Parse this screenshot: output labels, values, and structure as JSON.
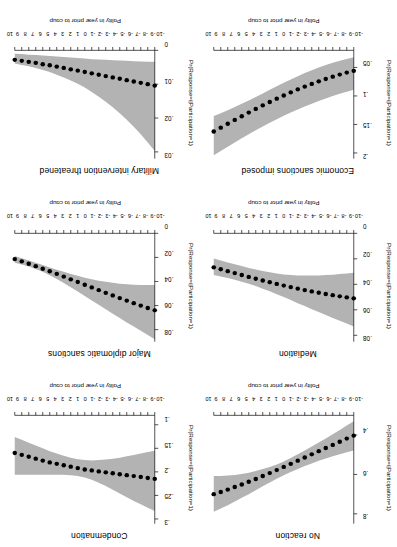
{
  "figure": {
    "orientation_degrees": 180,
    "band_color": "#b3b3b3",
    "point_color": "#000000",
    "axis_color": "#000000"
  },
  "chart_data": [
    {
      "type": "line",
      "title": "No reaction",
      "xlabel": "Polity in year prior to coup",
      "ylabel": "Pr(Response=i|Participation=1)",
      "x": [
        -10,
        -9,
        -8,
        -7,
        -6,
        -5,
        -4,
        -3,
        -2,
        -1,
        0,
        1,
        2,
        3,
        4,
        5,
        6,
        7,
        8,
        9,
        10
      ],
      "xticklabels": [
        "-10",
        "-9",
        "-8",
        "-7",
        "-6",
        "-5",
        "-4",
        "-3",
        "-2",
        "-1",
        "0",
        "1",
        "2",
        "3",
        "4",
        "5",
        "6",
        "7",
        "8",
        "9",
        "10"
      ],
      "yticklabels": [
        ".4",
        ".6",
        ".8"
      ],
      "ylim": [
        0.3,
        0.85
      ],
      "xlim": [
        -10,
        10
      ],
      "grid": false,
      "values": [
        0.403,
        0.418,
        0.434,
        0.45,
        0.466,
        0.482,
        0.498,
        0.514,
        0.53,
        0.546,
        0.562,
        0.578,
        0.593,
        0.608,
        0.623,
        0.637,
        0.651,
        0.664,
        0.677,
        0.689,
        0.7
      ],
      "band_lower": [
        0.33,
        0.352,
        0.374,
        0.396,
        0.417,
        0.438,
        0.458,
        0.478,
        0.498,
        0.517,
        0.534,
        0.549,
        0.562,
        0.573,
        0.583,
        0.592,
        0.598,
        0.603,
        0.606,
        0.608,
        0.608
      ],
      "band_upper": [
        0.478,
        0.487,
        0.497,
        0.508,
        0.519,
        0.531,
        0.544,
        0.557,
        0.572,
        0.588,
        0.604,
        0.622,
        0.641,
        0.66,
        0.68,
        0.7,
        0.719,
        0.738,
        0.756,
        0.773,
        0.79
      ]
    },
    {
      "type": "line",
      "title": "Condemnation",
      "xlabel": "Polity in year prior to coup",
      "ylabel": "Pr(Response=i|Participation=1)",
      "x": [
        -10,
        -9,
        -8,
        -7,
        -6,
        -5,
        -4,
        -3,
        -2,
        -1,
        0,
        1,
        2,
        3,
        4,
        5,
        6,
        7,
        8,
        9,
        10
      ],
      "xticklabels": [
        "-10",
        "-9",
        "-8",
        "-7",
        "-6",
        "-5",
        "-4",
        "-3",
        "-2",
        "-1",
        "0",
        "1",
        "2",
        "3",
        "4",
        "5",
        "6",
        "7",
        "8",
        "9",
        "10"
      ],
      "yticklabels": [
        ".1",
        ".15",
        ".2",
        ".25",
        ".3"
      ],
      "ylim": [
        0.08,
        0.31
      ],
      "xlim": [
        -10,
        10
      ],
      "grid": false,
      "values": [
        0.215,
        0.213,
        0.211,
        0.209,
        0.207,
        0.205,
        0.203,
        0.201,
        0.199,
        0.197,
        0.195,
        0.192,
        0.189,
        0.186,
        0.183,
        0.18,
        0.176,
        0.172,
        0.168,
        0.164,
        0.16
      ],
      "band_lower": [
        0.155,
        0.158,
        0.161,
        0.164,
        0.167,
        0.17,
        0.172,
        0.174,
        0.175,
        0.176,
        0.175,
        0.173,
        0.17,
        0.166,
        0.161,
        0.156,
        0.15,
        0.144,
        0.138,
        0.132,
        0.126
      ],
      "band_upper": [
        0.283,
        0.276,
        0.269,
        0.262,
        0.254,
        0.246,
        0.238,
        0.23,
        0.223,
        0.217,
        0.212,
        0.209,
        0.207,
        0.206,
        0.206,
        0.206,
        0.206,
        0.206,
        0.206,
        0.206,
        0.206
      ]
    },
    {
      "type": "line",
      "title": "Mediation",
      "xlabel": "Polity in year prior to coup",
      "ylabel": "Pr(Response=i|Participation=1)",
      "x": [
        -10,
        -9,
        -8,
        -7,
        -6,
        -5,
        -4,
        -3,
        -2,
        -1,
        0,
        1,
        2,
        3,
        4,
        5,
        6,
        7,
        8,
        9,
        10
      ],
      "xticklabels": [
        "-10",
        "-9",
        "-8",
        "-7",
        "-6",
        "-5",
        "-4",
        "-3",
        "-2",
        "-1",
        "0",
        "1",
        "2",
        "3",
        "4",
        "5",
        "6",
        "7",
        "8",
        "9",
        "10"
      ],
      "yticklabels": [
        "0",
        ".02",
        ".04",
        ".06",
        ".08"
      ],
      "ylim": [
        0.0,
        0.085
      ],
      "xlim": [
        -10,
        10
      ],
      "grid": false,
      "values": [
        0.051,
        0.0502,
        0.0494,
        0.0485,
        0.0476,
        0.0466,
        0.0456,
        0.0445,
        0.0434,
        0.0422,
        0.041,
        0.0397,
        0.0384,
        0.037,
        0.0356,
        0.0342,
        0.0327,
        0.0312,
        0.0297,
        0.0282,
        0.0267
      ],
      "band_lower": [
        0.031,
        0.0315,
        0.032,
        0.0324,
        0.0327,
        0.033,
        0.0331,
        0.0331,
        0.033,
        0.0327,
        0.0322,
        0.0315,
        0.0306,
        0.0296,
        0.0284,
        0.0271,
        0.0257,
        0.0243,
        0.0228,
        0.0213,
        0.0198
      ],
      "band_upper": [
        0.073,
        0.0708,
        0.0686,
        0.0664,
        0.0641,
        0.0618,
        0.0595,
        0.0571,
        0.0548,
        0.0524,
        0.05,
        0.0477,
        0.0455,
        0.0434,
        0.0414,
        0.0396,
        0.0379,
        0.0364,
        0.035,
        0.0338,
        0.0327
      ]
    },
    {
      "type": "line",
      "title": "Major diplomatic sanctions",
      "xlabel": "Polity in year prior to coup",
      "ylabel": "Pr(Response=i|Participation=1)",
      "x": [
        -10,
        -9,
        -8,
        -7,
        -6,
        -5,
        -4,
        -3,
        -2,
        -1,
        0,
        1,
        2,
        3,
        4,
        5,
        6,
        7,
        8,
        9,
        10
      ],
      "xticklabels": [
        "-10",
        "-9",
        "-8",
        "-7",
        "-6",
        "-5",
        "-4",
        "-3",
        "-2",
        "-1",
        "0",
        "1",
        "2",
        "3",
        "4",
        "5",
        "6",
        "7",
        "8",
        "9",
        "10"
      ],
      "yticklabels": [
        "0",
        ".02",
        ".04",
        ".06",
        ".08"
      ],
      "ylim": [
        0.0,
        0.09
      ],
      "xlim": [
        -10,
        10
      ],
      "grid": false,
      "values": [
        0.064,
        0.062,
        0.06,
        0.058,
        0.0559,
        0.0538,
        0.0516,
        0.0494,
        0.0472,
        0.0449,
        0.0427,
        0.0404,
        0.0382,
        0.0359,
        0.0337,
        0.0315,
        0.0294,
        0.0273,
        0.0253,
        0.0233,
        0.0214
      ],
      "band_lower": [
        0.043,
        0.043,
        0.0429,
        0.0427,
        0.0423,
        0.0418,
        0.0411,
        0.0403,
        0.0393,
        0.0381,
        0.0368,
        0.0353,
        0.0337,
        0.032,
        0.0302,
        0.0283,
        0.0264,
        0.0245,
        0.0226,
        0.0207,
        0.0189
      ],
      "band_upper": [
        0.088,
        0.0845,
        0.081,
        0.0775,
        0.074,
        0.0704,
        0.0668,
        0.0631,
        0.0594,
        0.0557,
        0.052,
        0.0483,
        0.0447,
        0.0412,
        0.0379,
        0.0348,
        0.032,
        0.0296,
        0.0275,
        0.0258,
        0.0245
      ]
    },
    {
      "type": "line",
      "title": "Economic sanctions imposed",
      "xlabel": "Polity in year prior to coup",
      "ylabel": "Pr(Response=i|Participation=1)",
      "x": [
        -10,
        -9,
        -8,
        -7,
        -6,
        -5,
        -4,
        -3,
        -2,
        -1,
        0,
        1,
        2,
        3,
        4,
        5,
        6,
        7,
        8,
        9,
        10
      ],
      "xticklabels": [
        "-10",
        "-9",
        "-8",
        "-7",
        "-6",
        "-5",
        "-4",
        "-3",
        "-2",
        "-1",
        "0",
        "1",
        "2",
        "3",
        "4",
        "5",
        "6",
        "7",
        "8",
        "9",
        "10"
      ],
      "yticklabels": [
        ".05",
        ".1",
        ".15",
        ".2"
      ],
      "ylim": [
        0.02,
        0.21
      ],
      "xlim": [
        -10,
        10
      ],
      "grid": false,
      "values": [
        0.056,
        0.059,
        0.0625,
        0.0662,
        0.0702,
        0.0744,
        0.0789,
        0.0836,
        0.0886,
        0.0938,
        0.0992,
        0.1048,
        0.1106,
        0.1166,
        0.1228,
        0.1291,
        0.1356,
        0.1421,
        0.1488,
        0.1556,
        0.1624
      ],
      "band_lower": [
        0.032,
        0.035,
        0.0383,
        0.0419,
        0.0459,
        0.0502,
        0.0549,
        0.0599,
        0.0653,
        0.071,
        0.0769,
        0.083,
        0.0892,
        0.0955,
        0.1017,
        0.1078,
        0.1138,
        0.1195,
        0.125,
        0.1302,
        0.1351
      ],
      "band_upper": [
        0.089,
        0.0925,
        0.0963,
        0.1003,
        0.1045,
        0.1089,
        0.1136,
        0.1185,
        0.1237,
        0.1291,
        0.1348,
        0.1408,
        0.147,
        0.1535,
        0.1602,
        0.1671,
        0.1742,
        0.1815,
        0.1889,
        0.1964,
        0.204
      ]
    },
    {
      "type": "line",
      "title": "Military intervention threatened",
      "xlabel": "Polity in year prior to coup",
      "ylabel": "Pr(Response=i|Participation=1)",
      "x": [
        -10,
        -9,
        -8,
        -7,
        -6,
        -5,
        -4,
        -3,
        -2,
        -1,
        0,
        1,
        2,
        3,
        4,
        5,
        6,
        7,
        8,
        9,
        10
      ],
      "xticklabels": [
        "-10",
        "-9",
        "-8",
        "-7",
        "-6",
        "-5",
        "-4",
        "-3",
        "-2",
        "-1",
        "0",
        "1",
        "2",
        "3",
        "4",
        "5",
        "6",
        "7",
        "8",
        "9",
        "10"
      ],
      "yticklabels": [
        "0",
        ".01",
        ".02",
        ".03"
      ],
      "ylim": [
        0.0,
        0.032
      ],
      "xlim": [
        -10,
        10
      ],
      "grid": false,
      "values": [
        0.0104,
        0.01,
        0.0096,
        0.0092,
        0.0088,
        0.0084,
        0.008,
        0.0076,
        0.0072,
        0.0068,
        0.0064,
        0.006,
        0.0056,
        0.0052,
        0.0048,
        0.0044,
        0.0041,
        0.0037,
        0.0034,
        0.0031,
        0.0028
      ],
      "band_lower": [
        0.0034,
        0.0034,
        0.0033,
        0.0032,
        0.0031,
        0.003,
        0.0029,
        0.0028,
        0.0027,
        0.0026,
        0.0024,
        0.0023,
        0.0021,
        0.002,
        0.0018,
        0.0017,
        0.0015,
        0.0014,
        0.0013,
        0.0011,
        0.001
      ],
      "band_upper": [
        0.0297,
        0.0272,
        0.0248,
        0.0226,
        0.0205,
        0.0186,
        0.0168,
        0.0152,
        0.0137,
        0.0123,
        0.011,
        0.0099,
        0.0089,
        0.008,
        0.0072,
        0.0064,
        0.0058,
        0.0052,
        0.0047,
        0.0043,
        0.0039
      ]
    }
  ]
}
